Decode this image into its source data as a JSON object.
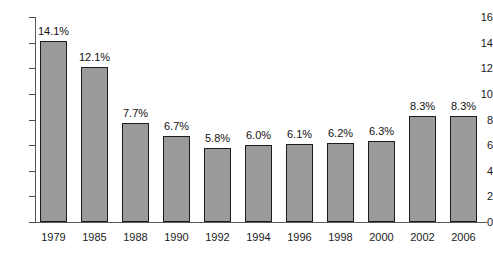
{
  "chart_data": {
    "type": "bar",
    "title": "",
    "subtitle": "",
    "xlabel": "",
    "ylabel": "",
    "categories": [
      "1979",
      "1985",
      "1988",
      "1990",
      "1992",
      "1994",
      "1996",
      "1998",
      "2000",
      "2002",
      "2006"
    ],
    "values": [
      14.1,
      12.1,
      7.7,
      6.7,
      5.8,
      6.0,
      6.1,
      6.2,
      6.3,
      8.3,
      8.3
    ],
    "data_labels": [
      "14.1%",
      "12.1%",
      "7.7%",
      "6.7%",
      "5.8%",
      "6.0%",
      "6.1%",
      "6.2%",
      "6.3%",
      "8.3%",
      "8.3%"
    ],
    "ylim": [
      0,
      16
    ],
    "ytick_values": [
      0,
      2,
      4,
      6,
      8,
      10,
      12,
      14,
      16
    ],
    "ytick_labels": [
      "0",
      "2",
      "4",
      "6",
      "8",
      "10",
      "12",
      "14",
      "16"
    ],
    "grid": false,
    "legend": null,
    "legend_position": "none",
    "colors": {
      "bar_fill": "#9a9a9a",
      "bar_border": "#1c1c1c",
      "axis": "#5a5a5a",
      "text": "#1a1a1a",
      "background": "#ffffff"
    }
  }
}
